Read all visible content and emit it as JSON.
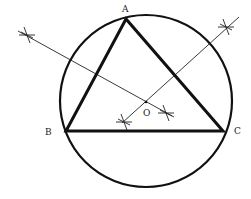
{
  "diagram": {
    "colors": {
      "stroke": "#111111",
      "label": "#222222",
      "background": "#ffffff"
    },
    "circle": {
      "cx": 146,
      "cy": 101,
      "r": 86
    },
    "vertices": [
      {
        "name": "A",
        "x": 126,
        "y": 19,
        "label": "A",
        "lx": 122,
        "ly": 12
      },
      {
        "name": "B",
        "x": 66,
        "y": 131,
        "label": "B",
        "lx": 45,
        "ly": 135
      },
      {
        "name": "C",
        "x": 223,
        "y": 131,
        "label": "C",
        "lx": 234,
        "ly": 134
      }
    ],
    "center": {
      "name": "O",
      "x": 146,
      "y": 102,
      "label": "O",
      "lx": 143,
      "ly": 116
    },
    "bisectors": [
      {
        "name": "perpendicular-bisector-AB",
        "x1": 18,
        "y1": 31,
        "x2": 174,
        "y2": 117
      },
      {
        "name": "perpendicular-bisector-AC",
        "x1": 122,
        "y1": 123,
        "x2": 239,
        "y2": 17
      }
    ],
    "arc_marks": [
      {
        "name": "arc-mark-ab-outer",
        "x": 27,
        "y": 35
      },
      {
        "name": "arc-mark-ab-inner",
        "x": 166,
        "y": 113
      },
      {
        "name": "arc-mark-ac-inner",
        "x": 124,
        "y": 122
      },
      {
        "name": "arc-mark-ac-outer",
        "x": 226,
        "y": 27
      }
    ]
  }
}
